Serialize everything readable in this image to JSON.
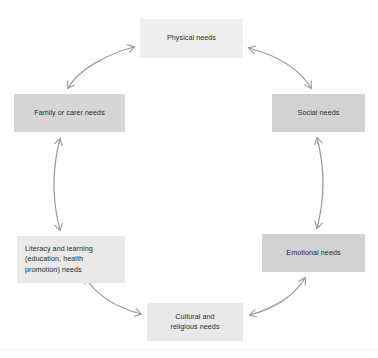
{
  "diagram": {
    "type": "cycle",
    "title": "",
    "shape": "circular-cycle-six-nodes",
    "background_color": "#ffffff",
    "arrow_color": "#9b9b9b",
    "text_color": "#2b2b2b",
    "nodes": [
      {
        "id": "physical",
        "label": "Physical needs",
        "position": "top",
        "fill": "#eeeeee",
        "align": "center"
      },
      {
        "id": "social",
        "label": "Social needs",
        "position": "top-right",
        "fill": "#d2d2d2",
        "align": "center"
      },
      {
        "id": "emotional",
        "label": "Emotional needs",
        "position": "bottom-right",
        "fill": "#d2d2d2",
        "align": "center"
      },
      {
        "id": "cultural",
        "label": "Cultural and\nreligious needs",
        "position": "bottom",
        "fill": "#e9e9e9",
        "align": "center"
      },
      {
        "id": "literacy",
        "label": "Literacy and learning\n(education, health\npromotion) needs",
        "position": "bottom-left",
        "fill": "#e9e9e9",
        "align": "left"
      },
      {
        "id": "family",
        "label": "Family or carer needs",
        "position": "top-left",
        "fill": "#d6d6d6",
        "align": "center"
      }
    ],
    "connectors": [
      {
        "id": "family-physical",
        "from": "family",
        "to": "physical",
        "style": "double-headed-curved-arrow"
      },
      {
        "id": "physical-social",
        "from": "physical",
        "to": "social",
        "style": "double-headed-curved-arrow"
      },
      {
        "id": "social-emotional",
        "from": "social",
        "to": "emotional",
        "style": "double-headed-curved-arrow"
      },
      {
        "id": "emotional-cultural",
        "from": "emotional",
        "to": "cultural",
        "style": "double-headed-curved-arrow"
      },
      {
        "id": "cultural-literacy",
        "from": "cultural",
        "to": "literacy",
        "style": "double-headed-curved-arrow"
      },
      {
        "id": "literacy-family",
        "from": "literacy",
        "to": "family",
        "style": "double-headed-curved-arrow"
      }
    ]
  }
}
